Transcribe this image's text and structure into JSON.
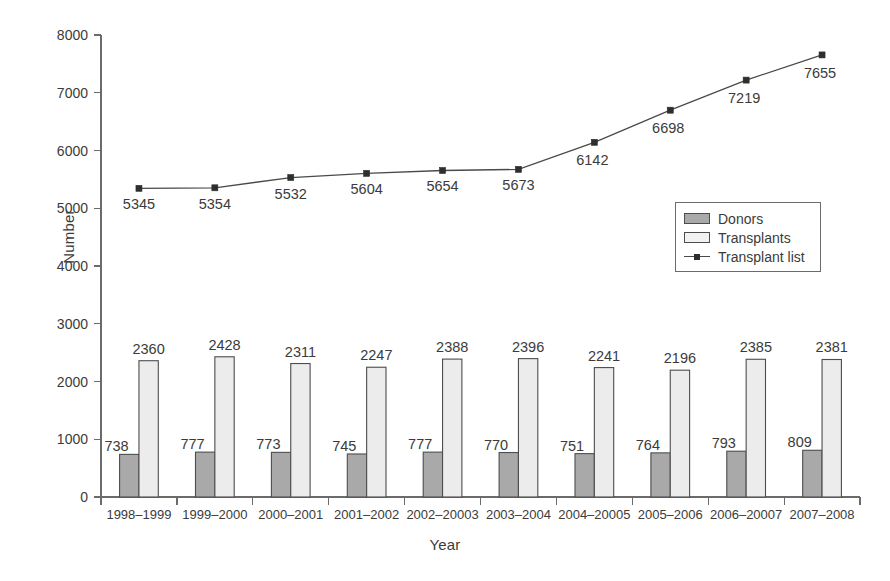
{
  "chart_data": {
    "type": "bar",
    "title": "",
    "subtitle": "",
    "xlabel": "Year",
    "ylabel": "Number",
    "ylim": [
      0,
      8000
    ],
    "ytick_step": 1000,
    "yticks": [
      "0",
      "1000",
      "2000",
      "3000",
      "4000",
      "5000",
      "6000",
      "7000",
      "8000"
    ],
    "grid": false,
    "legend_position": "center-right",
    "categories": [
      "1998–1999",
      "1999–2000",
      "2000–2001",
      "2001–2002",
      "2002–20003",
      "2003–2004",
      "2004–20005",
      "2005–2006",
      "2006–20007",
      "2007–2008"
    ],
    "series": [
      {
        "name": "Donors",
        "kind": "bar",
        "color": "#a9a9a9",
        "values": [
          738,
          777,
          773,
          745,
          777,
          770,
          751,
          764,
          793,
          809
        ]
      },
      {
        "name": "Transplants",
        "kind": "bar",
        "color": "#ececec",
        "values": [
          2360,
          2428,
          2311,
          2247,
          2388,
          2396,
          2241,
          2196,
          2385,
          2381
        ]
      },
      {
        "name": "Transplant list",
        "kind": "line",
        "color": "#4a4a4a",
        "marker": "square",
        "values": [
          5345,
          5354,
          5532,
          5604,
          5654,
          5673,
          6142,
          6698,
          7219,
          7655
        ]
      }
    ]
  },
  "legend": {
    "items": [
      {
        "label": "Donors",
        "swatch": "donors-swatch"
      },
      {
        "label": "Transplants",
        "swatch": "transplants-swatch"
      },
      {
        "label": "Transplant list",
        "swatch": "transplant-list-line-swatch"
      }
    ]
  },
  "axes": {
    "x_title": "Year",
    "y_title": "Number"
  }
}
